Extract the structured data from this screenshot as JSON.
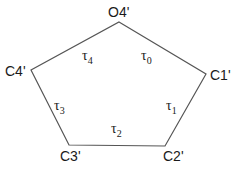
{
  "diagram": {
    "type": "pentagon-ring",
    "stroke_color": "#555555",
    "vertices": [
      {
        "id": "O4",
        "label": "O4'",
        "x": 119,
        "y": 22,
        "lx": 108,
        "ly": 17
      },
      {
        "id": "C1",
        "label": "C1'",
        "x": 206,
        "y": 74,
        "lx": 210,
        "ly": 80
      },
      {
        "id": "C2",
        "label": "C2'",
        "x": 165,
        "y": 146,
        "lx": 163,
        "ly": 161
      },
      {
        "id": "C3",
        "label": "C3'",
        "x": 69,
        "y": 145,
        "lx": 60,
        "ly": 161
      },
      {
        "id": "C4",
        "label": "C4'",
        "x": 31,
        "y": 70,
        "lx": 5,
        "ly": 76
      }
    ],
    "torsions": [
      {
        "symbol": "τ",
        "index": "0",
        "x": 141,
        "y": 60
      },
      {
        "symbol": "τ",
        "index": "1",
        "x": 166,
        "y": 110
      },
      {
        "symbol": "τ",
        "index": "2",
        "x": 111,
        "y": 133
      },
      {
        "symbol": "τ",
        "index": "3",
        "x": 54,
        "y": 110
      },
      {
        "symbol": "τ",
        "index": "4",
        "x": 82,
        "y": 60
      }
    ]
  }
}
